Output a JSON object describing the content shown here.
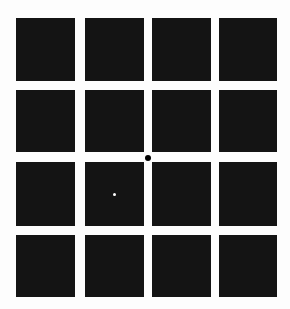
{
  "figure": {
    "background_color": "#fdfdfd",
    "square_color": "#141414",
    "columns": [
      {
        "x": 16,
        "w": 59
      },
      {
        "x": 85,
        "w": 59
      },
      {
        "x": 152,
        "w": 59
      },
      {
        "x": 219,
        "w": 58
      }
    ],
    "rows": [
      {
        "y": 18,
        "h": 63
      },
      {
        "y": 90,
        "h": 62
      },
      {
        "y": 162,
        "h": 64
      },
      {
        "y": 235,
        "h": 62
      }
    ],
    "dots": [
      {
        "name": "black-fixation-dot",
        "cx": 148,
        "cy": 158,
        "r": 3,
        "color": "#000000"
      },
      {
        "name": "white-dot",
        "cx": 114,
        "cy": 194,
        "r": 1.5,
        "color": "#ffffff"
      }
    ]
  }
}
